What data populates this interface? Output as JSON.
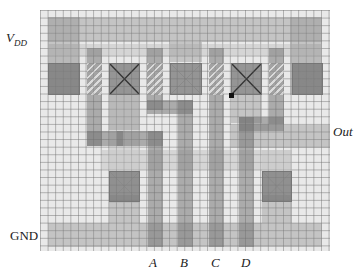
{
  "labels": {
    "vdd_main": "V",
    "vdd_sub": "DD",
    "gnd": "GND",
    "out": "Out",
    "inputs": [
      "A",
      "B",
      "C",
      "D"
    ]
  },
  "layers": {
    "diffusion": [
      {
        "x": 48,
        "y": 44,
        "w": 274,
        "h": 12
      },
      {
        "x": 48,
        "y": 44,
        "w": 32,
        "h": 51
      },
      {
        "x": 290,
        "y": 44,
        "w": 32,
        "h": 51
      },
      {
        "x": 109,
        "y": 95,
        "w": 31,
        "h": 108
      },
      {
        "x": 262,
        "y": 150,
        "w": 30,
        "h": 52
      },
      {
        "x": 102,
        "y": 150,
        "w": 190,
        "h": 20
      }
    ],
    "metal": [
      {
        "x": 48,
        "y": 17,
        "w": 274,
        "h": 25
      },
      {
        "x": 48,
        "y": 17,
        "w": 32,
        "h": 78
      },
      {
        "x": 290,
        "y": 17,
        "w": 32,
        "h": 78
      },
      {
        "x": 170,
        "y": 42,
        "w": 32,
        "h": 20
      },
      {
        "x": 48,
        "y": 223,
        "w": 274,
        "h": 24
      },
      {
        "x": 109,
        "y": 95,
        "w": 31,
        "h": 35
      },
      {
        "x": 231,
        "y": 95,
        "w": 31,
        "h": 28
      },
      {
        "x": 231,
        "y": 125,
        "w": 99,
        "h": 23
      },
      {
        "x": 262,
        "y": 195,
        "w": 30,
        "h": 28
      },
      {
        "x": 109,
        "y": 195,
        "w": 31,
        "h": 28
      }
    ],
    "poly": [
      {
        "x": 87,
        "y": 48,
        "w": 15,
        "h": 98
      },
      {
        "x": 87,
        "y": 131,
        "w": 36,
        "h": 15
      },
      {
        "x": 117,
        "y": 131,
        "w": 46,
        "h": 15
      },
      {
        "x": 148,
        "y": 131,
        "w": 15,
        "h": 116
      },
      {
        "x": 147,
        "y": 48,
        "w": 16,
        "h": 62
      },
      {
        "x": 147,
        "y": 100,
        "w": 46,
        "h": 14
      },
      {
        "x": 178,
        "y": 100,
        "w": 15,
        "h": 147
      },
      {
        "x": 209,
        "y": 48,
        "w": 15,
        "h": 199
      },
      {
        "x": 269,
        "y": 48,
        "w": 15,
        "h": 76
      },
      {
        "x": 239,
        "y": 117,
        "w": 45,
        "h": 14
      },
      {
        "x": 239,
        "y": 117,
        "w": 15,
        "h": 130
      }
    ],
    "gates_hatched": [
      {
        "x": 87,
        "y": 63,
        "w": 15,
        "h": 32
      },
      {
        "x": 147,
        "y": 63,
        "w": 16,
        "h": 32
      },
      {
        "x": 209,
        "y": 63,
        "w": 15,
        "h": 32
      },
      {
        "x": 269,
        "y": 63,
        "w": 15,
        "h": 32
      }
    ],
    "contacts": [
      {
        "x": 48,
        "y": 63,
        "w": 32,
        "h": 32,
        "bold": false
      },
      {
        "x": 109,
        "y": 63,
        "w": 31,
        "h": 32,
        "bold": true
      },
      {
        "x": 170,
        "y": 63,
        "w": 32,
        "h": 32,
        "bold": false
      },
      {
        "x": 231,
        "y": 63,
        "w": 31,
        "h": 32,
        "bold": true
      },
      {
        "x": 292,
        "y": 63,
        "w": 31,
        "h": 32,
        "bold": false
      },
      {
        "x": 109,
        "y": 171,
        "w": 31,
        "h": 31,
        "bold": false
      },
      {
        "x": 262,
        "y": 171,
        "w": 30,
        "h": 31,
        "bold": false
      }
    ],
    "node_dot": {
      "x": 229,
      "y": 93
    }
  }
}
